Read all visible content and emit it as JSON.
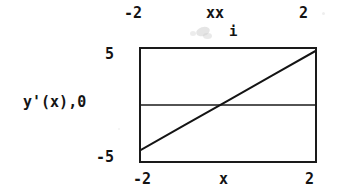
{
  "chart_data": {
    "type": "line",
    "title": "",
    "xlabel_top": "xx",
    "xlabel_top_subscript": "i",
    "xlabel_bottom": "x",
    "ylabel": "y'(x),",
    "xlim": [
      -2,
      2
    ],
    "ylim": [
      -5,
      5
    ],
    "x_ticks_top": [
      "-2",
      "2"
    ],
    "x_ticks_bottom": [
      "-2",
      "2"
    ],
    "y_ticks": [
      "5",
      "0",
      "-5"
    ],
    "grid": false,
    "legend": "none",
    "zero_line": true,
    "series": [
      {
        "name": "y'(x)",
        "x": [
          -2,
          -1,
          0,
          1,
          2
        ],
        "values": [
          -4.0,
          -1.8,
          0.4,
          2.6,
          4.8
        ]
      }
    ],
    "annotations": []
  },
  "axes": {
    "top": {
      "tick_left": "-2",
      "tick_right": "2",
      "variable": "xx",
      "subscript": "i"
    },
    "bottom": {
      "tick_left": "-2",
      "tick_right": "2",
      "variable": "x"
    },
    "left": {
      "tick_top": "5",
      "tick_middle": "0",
      "tick_bottom": "-5",
      "variable": "y'(x),"
    }
  },
  "colors": {
    "ink": "#1a1a1a",
    "background": "#ffffff",
    "smudge": "#cfcfcf"
  }
}
